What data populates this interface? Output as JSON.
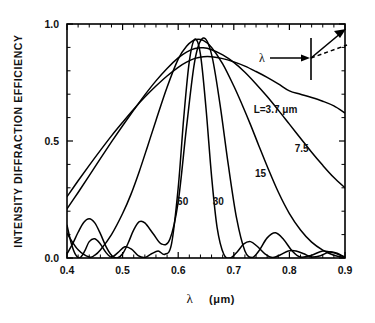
{
  "figure": {
    "name": "intensity-diffraction-efficiency-plot",
    "background_color": "#ffffff",
    "line_color": "#000000"
  },
  "chart_data": {
    "type": "line",
    "title": "",
    "xlabel": "λ  (μm)",
    "ylabel": "INTENSITY  DIFFRACTION  EFFICIENCY",
    "xlim": [
      0.4,
      0.9
    ],
    "ylim": [
      0.0,
      1.0
    ],
    "grid": false,
    "legend_position": "inline-curve-labels",
    "xticks": [
      0.4,
      0.5,
      0.6,
      0.7,
      0.8,
      0.9
    ],
    "xtick_labels": [
      "0.4",
      "0.5",
      "0.6",
      "0.7",
      "0.8",
      "0.9"
    ],
    "x_minor_ticks_per_interval": 4,
    "yticks": [
      0.0,
      0.5,
      1.0
    ],
    "ytick_labels": [
      "0.0",
      "0.5",
      "1.0"
    ],
    "y_minor_ticks_per_interval": 4,
    "peak_wavelength_um": 0.63,
    "peak_efficiency": 0.935,
    "series": [
      {
        "name": "L=3.7 μm",
        "L_um": 3.7,
        "label": "L=3.7 μm",
        "label_x": 0.775,
        "label_y": 0.62,
        "x": [
          0.4,
          0.42,
          0.44,
          0.46,
          0.48,
          0.5,
          0.52,
          0.54,
          0.56,
          0.58,
          0.6,
          0.615,
          0.63,
          0.645,
          0.66,
          0.68,
          0.7,
          0.72,
          0.74,
          0.76,
          0.78,
          0.8,
          0.82,
          0.84,
          0.86,
          0.88,
          0.9
        ],
        "y": [
          0.262,
          0.33,
          0.396,
          0.46,
          0.522,
          0.58,
          0.636,
          0.688,
          0.735,
          0.778,
          0.815,
          0.837,
          0.853,
          0.86,
          0.86,
          0.852,
          0.838,
          0.82,
          0.797,
          0.772,
          0.744,
          0.714,
          0.7,
          0.686,
          0.67,
          0.65,
          0.62
        ]
      },
      {
        "name": "7.5",
        "L_um": 7.5,
        "label": "7.5",
        "label_x": 0.822,
        "label_y": 0.455,
        "x": [
          0.4,
          0.42,
          0.44,
          0.46,
          0.48,
          0.5,
          0.52,
          0.54,
          0.56,
          0.58,
          0.6,
          0.615,
          0.63,
          0.645,
          0.66,
          0.68,
          0.7,
          0.72,
          0.74,
          0.76,
          0.78,
          0.8,
          0.82,
          0.84,
          0.86,
          0.88,
          0.9
        ],
        "y": [
          0.21,
          0.28,
          0.352,
          0.425,
          0.496,
          0.565,
          0.632,
          0.697,
          0.757,
          0.81,
          0.855,
          0.88,
          0.895,
          0.898,
          0.89,
          0.868,
          0.836,
          0.794,
          0.744,
          0.69,
          0.632,
          0.572,
          0.512,
          0.452,
          0.396,
          0.344,
          0.3
        ]
      },
      {
        "name": "15",
        "L_um": 15,
        "label": "15",
        "label_x": 0.748,
        "label_y": 0.345,
        "x": [
          0.4,
          0.42,
          0.44,
          0.45,
          0.46,
          0.48,
          0.5,
          0.515,
          0.53,
          0.545,
          0.56,
          0.58,
          0.6,
          0.615,
          0.63,
          0.645,
          0.66,
          0.68,
          0.7,
          0.715,
          0.73,
          0.745,
          0.76,
          0.78,
          0.8,
          0.82,
          0.84,
          0.86,
          0.88,
          0.9
        ],
        "y": [
          0.105,
          0.035,
          0.004,
          0.012,
          0.034,
          0.1,
          0.19,
          0.272,
          0.37,
          0.478,
          0.588,
          0.73,
          0.85,
          0.905,
          0.933,
          0.93,
          0.9,
          0.83,
          0.735,
          0.655,
          0.57,
          0.48,
          0.392,
          0.282,
          0.19,
          0.12,
          0.068,
          0.034,
          0.012,
          0.002
        ]
      },
      {
        "name": "30",
        "L_um": 30,
        "label": "30",
        "label_x": 0.672,
        "label_y": 0.225,
        "x": [
          0.4,
          0.41,
          0.42,
          0.43,
          0.44,
          0.45,
          0.46,
          0.47,
          0.48,
          0.49,
          0.5,
          0.51,
          0.52,
          0.53,
          0.54,
          0.555,
          0.57,
          0.585,
          0.6,
          0.615,
          0.63,
          0.645,
          0.66,
          0.675,
          0.69,
          0.705,
          0.72,
          0.733,
          0.745,
          0.76,
          0.775,
          0.79,
          0.805,
          0.82,
          0.84,
          0.86,
          0.88,
          0.9
        ],
        "y": [
          0.018,
          0.06,
          0.11,
          0.152,
          0.168,
          0.15,
          0.104,
          0.05,
          0.012,
          0.0,
          0.018,
          0.064,
          0.12,
          0.155,
          0.15,
          0.104,
          0.06,
          0.08,
          0.24,
          0.56,
          0.845,
          0.94,
          0.87,
          0.66,
          0.4,
          0.17,
          0.03,
          0.002,
          0.03,
          0.086,
          0.108,
          0.078,
          0.03,
          0.004,
          0.012,
          0.03,
          0.022,
          0.004
        ]
      },
      {
        "name": "60",
        "L_um": 60,
        "label": "60",
        "label_x": 0.608,
        "label_y": 0.228,
        "x": [
          0.4,
          0.408,
          0.416,
          0.424,
          0.432,
          0.44,
          0.45,
          0.46,
          0.47,
          0.48,
          0.492,
          0.504,
          0.516,
          0.528,
          0.54,
          0.552,
          0.564,
          0.576,
          0.588,
          0.6,
          0.61,
          0.62,
          0.63,
          0.64,
          0.65,
          0.66,
          0.67,
          0.682,
          0.694,
          0.706,
          0.718,
          0.73,
          0.742,
          0.756,
          0.77,
          0.784,
          0.798,
          0.812,
          0.826,
          0.84,
          0.856,
          0.872,
          0.886,
          0.9
        ],
        "y": [
          0.14,
          0.06,
          0.012,
          0.002,
          0.03,
          0.07,
          0.082,
          0.06,
          0.024,
          0.004,
          0.024,
          0.048,
          0.038,
          0.01,
          0.002,
          0.018,
          0.03,
          0.016,
          0.06,
          0.3,
          0.6,
          0.84,
          0.935,
          0.87,
          0.64,
          0.35,
          0.13,
          0.016,
          0.0,
          0.026,
          0.06,
          0.07,
          0.05,
          0.018,
          0.002,
          0.014,
          0.03,
          0.03,
          0.018,
          0.004,
          0.01,
          0.026,
          0.02,
          0.002
        ]
      }
    ]
  },
  "inset": {
    "name": "grating-diffraction-diagram",
    "incident_label": "λ",
    "elements": [
      "incident-ray-arrow",
      "grating-line",
      "diffracted-ray-arrow",
      "zero-order-dashed-ray"
    ]
  },
  "axis_labels": {
    "y_title": "INTENSITY  DIFFRACTION  EFFICIENCY",
    "x_title_lambda": "λ",
    "x_title_units": "(μm)"
  }
}
